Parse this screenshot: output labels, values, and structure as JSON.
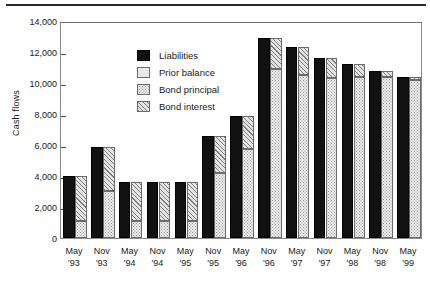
{
  "chart_data": {
    "type": "bar",
    "title": "",
    "subtitle": "",
    "xlabel": "",
    "ylabel": "Cash flows",
    "ylim": [
      0,
      14000
    ],
    "ytick_values": [
      0,
      2000,
      4000,
      6000,
      8000,
      10000,
      12000,
      14000
    ],
    "ytick_labels": [
      "0",
      "2,000",
      "4,000",
      "6,000",
      "8,000",
      "10,000",
      "12,000",
      "14,000"
    ],
    "grid": false,
    "legend_position": "upper-left-inside",
    "legend": [
      {
        "key": "liabilities",
        "label": "Liabilities",
        "swatch": "solid-black"
      },
      {
        "key": "prior_balance",
        "label": "Prior balance",
        "swatch": "light-plain"
      },
      {
        "key": "bond_principal",
        "label": "Bond principal",
        "swatch": "dotted-stipple"
      },
      {
        "key": "bond_interest",
        "label": "Bond interest",
        "swatch": "diagonal-hatch"
      }
    ],
    "categories": [
      "May '93",
      "Nov '93",
      "May '94",
      "Nov '94",
      "May '95",
      "Nov '95",
      "May '96",
      "Nov '96",
      "May '97",
      "Nov '97",
      "May '98",
      "Nov '98",
      "May '99"
    ],
    "category_months": [
      "May",
      "Nov",
      "May",
      "Nov",
      "May",
      "Nov",
      "May",
      "Nov",
      "May",
      "Nov",
      "May",
      "Nov",
      "May"
    ],
    "category_years": [
      "'93",
      "'93",
      "'94",
      "'94",
      "'95",
      "'95",
      "'96",
      "'96",
      "'97",
      "'97",
      "'98",
      "'98",
      "'99"
    ],
    "series": [
      {
        "name": "Liabilities",
        "values": [
          4000,
          5900,
          3600,
          3600,
          3600,
          6600,
          7900,
          12900,
          12300,
          11600,
          11200,
          10800,
          10400
        ]
      },
      {
        "name": "Bond principal",
        "values": [
          1100,
          3050,
          1100,
          1100,
          1100,
          4200,
          5750,
          10900,
          10500,
          10300,
          10400,
          10400,
          10200
        ]
      },
      {
        "name": "Bond interest",
        "values": [
          2900,
          2850,
          2500,
          2500,
          2500,
          2400,
          2150,
          2000,
          1800,
          1300,
          800,
          400,
          200
        ]
      }
    ],
    "stacked_totals": [
      4000,
      5900,
      3600,
      3600,
      3600,
      6600,
      7900,
      12900,
      12300,
      11600,
      11200,
      10800,
      10400
    ]
  },
  "colors": {
    "liabilities": "#111111",
    "bond_principal": "#ededed",
    "bond_interest": "#e4e4e4",
    "prior_balance": "#e9e9e9",
    "axis": "#8a8a8a",
    "text": "#1a1a1a"
  }
}
